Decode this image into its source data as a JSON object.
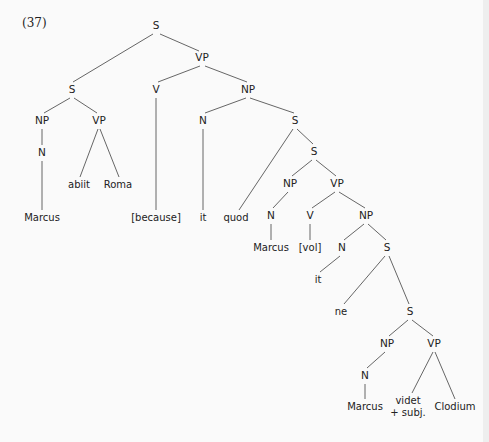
{
  "figure": {
    "example_number": "(37)",
    "nodes": [
      {
        "id": "s_root",
        "label": "S",
        "x": 156,
        "y": 26,
        "type": "category"
      },
      {
        "id": "s_left",
        "label": "S",
        "x": 72,
        "y": 90,
        "type": "category"
      },
      {
        "id": "vp_top",
        "label": "VP",
        "x": 202,
        "y": 58,
        "type": "category"
      },
      {
        "id": "np_marcus1",
        "label": "NP",
        "x": 42,
        "y": 121,
        "type": "category"
      },
      {
        "id": "vp_abiit",
        "label": "VP",
        "x": 99,
        "y": 121,
        "type": "category"
      },
      {
        "id": "n_marcus1",
        "label": "N",
        "x": 42,
        "y": 153,
        "type": "category"
      },
      {
        "id": "w_abiit",
        "label": "abiit",
        "x": 79,
        "y": 185,
        "type": "word"
      },
      {
        "id": "w_roma",
        "label": "Roma",
        "x": 118,
        "y": 185,
        "type": "word"
      },
      {
        "id": "w_marcus1",
        "label": "Marcus",
        "x": 42,
        "y": 218,
        "type": "word"
      },
      {
        "id": "v_because",
        "label": "V",
        "x": 156,
        "y": 90,
        "type": "category"
      },
      {
        "id": "w_because",
        "label": "[because]",
        "x": 156,
        "y": 218,
        "type": "word"
      },
      {
        "id": "np_it1",
        "label": "NP",
        "x": 248,
        "y": 90,
        "type": "category"
      },
      {
        "id": "n_it1",
        "label": "N",
        "x": 203,
        "y": 121,
        "type": "category"
      },
      {
        "id": "w_it1",
        "label": "it",
        "x": 203,
        "y": 218,
        "type": "word"
      },
      {
        "id": "s_quod",
        "label": "S",
        "x": 295,
        "y": 121,
        "type": "category"
      },
      {
        "id": "w_quod",
        "label": "quod",
        "x": 236,
        "y": 218,
        "type": "word"
      },
      {
        "id": "s_inner1",
        "label": "S",
        "x": 314,
        "y": 152,
        "type": "category"
      },
      {
        "id": "np_marcus2",
        "label": "NP",
        "x": 290,
        "y": 184,
        "type": "category"
      },
      {
        "id": "vp_vol",
        "label": "VP",
        "x": 337,
        "y": 184,
        "type": "category"
      },
      {
        "id": "n_marcus2",
        "label": "N",
        "x": 271,
        "y": 216,
        "type": "category"
      },
      {
        "id": "w_marcus2",
        "label": "Marcus",
        "x": 271,
        "y": 248,
        "type": "word"
      },
      {
        "id": "v_vol",
        "label": "V",
        "x": 310,
        "y": 216,
        "type": "category"
      },
      {
        "id": "w_vol",
        "label": "[vol]",
        "x": 310,
        "y": 248,
        "type": "word"
      },
      {
        "id": "np_it2",
        "label": "NP",
        "x": 366,
        "y": 216,
        "type": "category"
      },
      {
        "id": "n_it2",
        "label": "N",
        "x": 342,
        "y": 248,
        "type": "category"
      },
      {
        "id": "w_it2",
        "label": "it",
        "x": 318,
        "y": 280,
        "type": "word"
      },
      {
        "id": "s_ne",
        "label": "S",
        "x": 387,
        "y": 248,
        "type": "category"
      },
      {
        "id": "w_ne",
        "label": "ne",
        "x": 341,
        "y": 312,
        "type": "word"
      },
      {
        "id": "s_inner2",
        "label": "S",
        "x": 410,
        "y": 312,
        "type": "category"
      },
      {
        "id": "np_marcus3",
        "label": "NP",
        "x": 387,
        "y": 344,
        "type": "category"
      },
      {
        "id": "vp_videt",
        "label": "VP",
        "x": 434,
        "y": 344,
        "type": "category"
      },
      {
        "id": "n_marcus3",
        "label": "N",
        "x": 365,
        "y": 376,
        "type": "category"
      },
      {
        "id": "w_marcus3",
        "label": "Marcus",
        "x": 365,
        "y": 407,
        "type": "word"
      },
      {
        "id": "w_videt",
        "label": "videt",
        "x": 408,
        "y": 401,
        "type": "word"
      },
      {
        "id": "w_subj",
        "label": "+ subj.",
        "x": 408,
        "y": 413,
        "type": "word"
      },
      {
        "id": "w_clodium",
        "label": "Clodium",
        "x": 455,
        "y": 407,
        "type": "word"
      }
    ],
    "edges": [
      {
        "x1": 153,
        "y1": 34,
        "x2": 73,
        "y2": 82
      },
      {
        "x1": 160,
        "y1": 34,
        "x2": 199,
        "y2": 51
      },
      {
        "x1": 70,
        "y1": 98,
        "x2": 44,
        "y2": 113
      },
      {
        "x1": 74,
        "y1": 98,
        "x2": 97,
        "y2": 113
      },
      {
        "x1": 42,
        "y1": 129,
        "x2": 42,
        "y2": 145
      },
      {
        "x1": 42,
        "y1": 161,
        "x2": 42,
        "y2": 210
      },
      {
        "x1": 98,
        "y1": 129,
        "x2": 80,
        "y2": 177
      },
      {
        "x1": 100,
        "y1": 129,
        "x2": 119,
        "y2": 177
      },
      {
        "x1": 200,
        "y1": 66,
        "x2": 158,
        "y2": 82
      },
      {
        "x1": 205,
        "y1": 66,
        "x2": 247,
        "y2": 82
      },
      {
        "x1": 156,
        "y1": 98,
        "x2": 156,
        "y2": 210
      },
      {
        "x1": 246,
        "y1": 98,
        "x2": 205,
        "y2": 113
      },
      {
        "x1": 250,
        "y1": 98,
        "x2": 294,
        "y2": 113
      },
      {
        "x1": 203,
        "y1": 129,
        "x2": 203,
        "y2": 210
      },
      {
        "x1": 293,
        "y1": 129,
        "x2": 239,
        "y2": 210
      },
      {
        "x1": 297,
        "y1": 129,
        "x2": 313,
        "y2": 144
      },
      {
        "x1": 312,
        "y1": 160,
        "x2": 292,
        "y2": 176
      },
      {
        "x1": 316,
        "y1": 160,
        "x2": 336,
        "y2": 176
      },
      {
        "x1": 288,
        "y1": 192,
        "x2": 273,
        "y2": 208
      },
      {
        "x1": 271,
        "y1": 224,
        "x2": 271,
        "y2": 240
      },
      {
        "x1": 335,
        "y1": 192,
        "x2": 312,
        "y2": 208
      },
      {
        "x1": 339,
        "y1": 192,
        "x2": 365,
        "y2": 208
      },
      {
        "x1": 310,
        "y1": 224,
        "x2": 310,
        "y2": 240
      },
      {
        "x1": 364,
        "y1": 224,
        "x2": 344,
        "y2": 240
      },
      {
        "x1": 368,
        "y1": 224,
        "x2": 386,
        "y2": 240
      },
      {
        "x1": 340,
        "y1": 256,
        "x2": 320,
        "y2": 272
      },
      {
        "x1": 385,
        "y1": 256,
        "x2": 344,
        "y2": 304
      },
      {
        "x1": 389,
        "y1": 256,
        "x2": 409,
        "y2": 304
      },
      {
        "x1": 408,
        "y1": 320,
        "x2": 389,
        "y2": 336
      },
      {
        "x1": 412,
        "y1": 320,
        "x2": 433,
        "y2": 336
      },
      {
        "x1": 385,
        "y1": 352,
        "x2": 367,
        "y2": 368
      },
      {
        "x1": 365,
        "y1": 384,
        "x2": 365,
        "y2": 399
      },
      {
        "x1": 433,
        "y1": 352,
        "x2": 412,
        "y2": 393
      },
      {
        "x1": 435,
        "y1": 352,
        "x2": 455,
        "y2": 399
      }
    ]
  }
}
